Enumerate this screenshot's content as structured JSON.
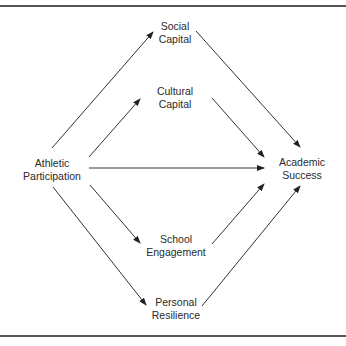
{
  "diagram": {
    "nodes": {
      "social_capital": {
        "line1": "Social",
        "line2": "Capital"
      },
      "cultural_capital": {
        "line1": "Cultural",
        "line2": "Capital"
      },
      "athletic_participation": {
        "line1": "Athletic",
        "line2": "Participation"
      },
      "academic_success": {
        "line1": "Academic",
        "line2": "Success"
      },
      "school_engagement": {
        "line1": "School",
        "line2": "Engagement"
      },
      "personal_resilience": {
        "line1": "Personal",
        "line2": "Resilience"
      }
    },
    "edges": [
      {
        "from": "Athletic Participation",
        "to": "Social Capital"
      },
      {
        "from": "Athletic Participation",
        "to": "Cultural Capital"
      },
      {
        "from": "Athletic Participation",
        "to": "Academic Success"
      },
      {
        "from": "Athletic Participation",
        "to": "School Engagement"
      },
      {
        "from": "Athletic Participation",
        "to": "Personal Resilience"
      },
      {
        "from": "Social Capital",
        "to": "Academic Success"
      },
      {
        "from": "Cultural Capital",
        "to": "Academic Success"
      },
      {
        "from": "School Engagement",
        "to": "Academic Success"
      },
      {
        "from": "Personal Resilience",
        "to": "Academic Success"
      }
    ],
    "line_color": "#333333"
  }
}
